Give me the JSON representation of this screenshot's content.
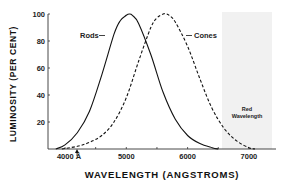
{
  "chart_data": {
    "type": "line",
    "title": "",
    "xlabel": "WAVELENGTH (ANGSTROMS)",
    "ylabel": "LUMINOSITY (PER CENT)",
    "xlim": [
      3700,
      7350
    ],
    "ylim": [
      0,
      100
    ],
    "x_ticks": [
      {
        "value": 4000,
        "label": "4000 Å"
      },
      {
        "value": 5000,
        "label": "5000"
      },
      {
        "value": 6000,
        "label": "6000"
      },
      {
        "value": 7000,
        "label": "7000"
      }
    ],
    "x_minor_ticks": [
      4500,
      5500,
      6500
    ],
    "y_ticks": [
      {
        "value": 20,
        "label": "20"
      },
      {
        "value": 40,
        "label": "40"
      },
      {
        "value": 60,
        "label": "60"
      },
      {
        "value": 80,
        "label": "80"
      },
      {
        "value": 100,
        "label": "100"
      }
    ],
    "grid": false,
    "series": [
      {
        "name": "Rods",
        "style": "solid",
        "x": [
          3850,
          4000,
          4200,
          4400,
          4600,
          4800,
          4900,
          5000,
          5050,
          5100,
          5200,
          5400,
          5600,
          5800,
          6000,
          6200,
          6400,
          6500
        ],
        "values": [
          0,
          3,
          12,
          28,
          55,
          85,
          95,
          99,
          100,
          99,
          93,
          70,
          42,
          22,
          10,
          4,
          1,
          0
        ]
      },
      {
        "name": "Cones",
        "style": "dashed",
        "x": [
          3950,
          4200,
          4400,
          4600,
          4800,
          5000,
          5200,
          5400,
          5500,
          5600,
          5650,
          5700,
          5800,
          6000,
          6200,
          6400,
          6600,
          6800,
          7000,
          7100
        ],
        "values": [
          0,
          2,
          5,
          10,
          20,
          38,
          65,
          90,
          97,
          100,
          100,
          99,
          94,
          76,
          52,
          30,
          15,
          6,
          1,
          0
        ]
      }
    ],
    "annotations": [
      {
        "text": "Rods",
        "target_series": "Rods"
      },
      {
        "text": "Cones",
        "target_series": "Cones"
      },
      {
        "text_lines": [
          "Red",
          "Wavelength"
        ],
        "region": [
          6550,
          7350
        ],
        "shaded": true
      }
    ]
  },
  "labels": {
    "x_axis_title": "WAVELENGTH (ANGSTROMS)",
    "y_axis_title": "LUMINOSITY (PER CENT)",
    "rods": "Rods",
    "cones": "Cones",
    "red_line1": "Red",
    "red_line2": "Wavelength"
  },
  "colors": {
    "line": "#111111",
    "shade": "#f1f1f1",
    "axis": "#333333"
  }
}
